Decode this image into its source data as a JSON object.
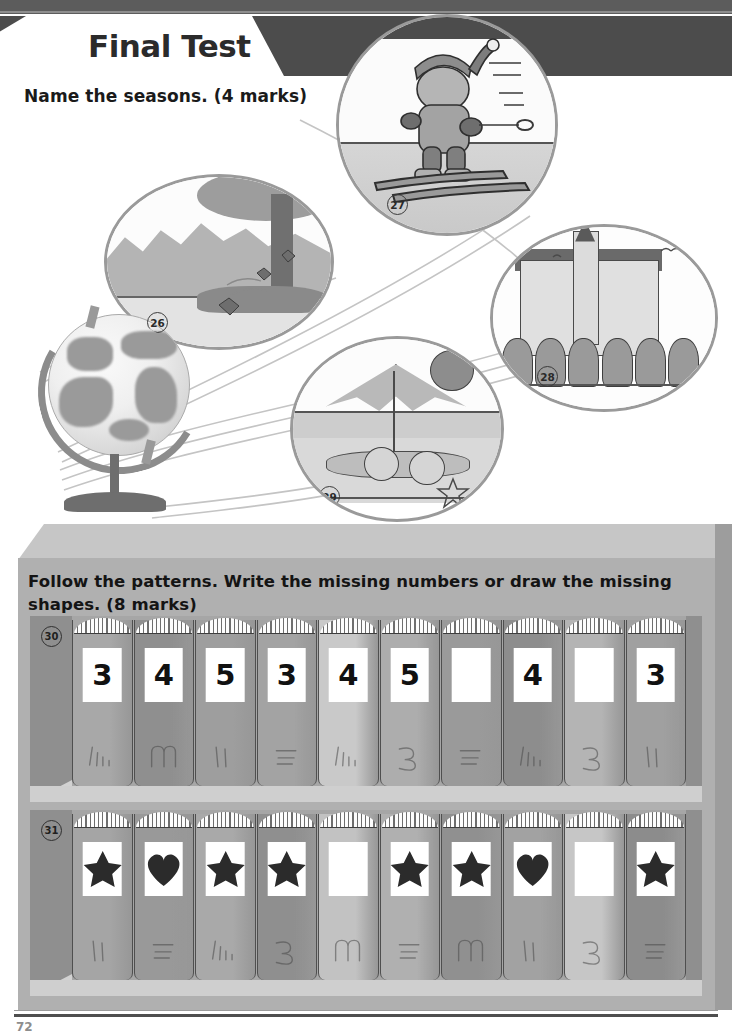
{
  "header": {
    "title": "Final Test"
  },
  "questions": {
    "seasons": {
      "prompt": "Name the seasons.  (4 marks)",
      "items": [
        {
          "number": "26",
          "scene": "autumn-falling-leaves-tree"
        },
        {
          "number": "27",
          "scene": "winter-child-skiing"
        },
        {
          "number": "28",
          "scene": "spring-castle-with-tulips"
        },
        {
          "number": "29",
          "scene": "summer-beach-umbrella-children"
        }
      ]
    },
    "patterns": {
      "prompt": "Follow the patterns.  Write the missing numbers or draw the missing shapes.  (8 marks)",
      "rows": [
        {
          "number": "30",
          "kind": "numbers",
          "books": [
            {
              "label": "3",
              "spine": "#a8a8a8",
              "scribble": "tally"
            },
            {
              "label": "4",
              "spine": "#8f8f8f",
              "scribble": "squiggle"
            },
            {
              "label": "5",
              "spine": "#9e9e9e",
              "scribble": "strokes"
            },
            {
              "label": "3",
              "spine": "#a3a3a3",
              "scribble": "lines"
            },
            {
              "label": "4",
              "spine": "#c9c9c9",
              "scribble": "tally"
            },
            {
              "label": "5",
              "spine": "#adadad",
              "scribble": "three"
            },
            {
              "label": "",
              "spine": "#9a9a9a",
              "scribble": "lines"
            },
            {
              "label": "4",
              "spine": "#8d8d8d",
              "scribble": "tally"
            },
            {
              "label": "",
              "spine": "#b4b4b4",
              "scribble": "three"
            },
            {
              "label": "3",
              "spine": "#a0a0a0",
              "scribble": "strokes"
            }
          ]
        },
        {
          "number": "31",
          "kind": "shapes",
          "books": [
            {
              "label": "star",
              "spine": "#a5a5a5",
              "scribble": "strokes"
            },
            {
              "label": "heart",
              "spine": "#999999",
              "scribble": "lines"
            },
            {
              "label": "star",
              "spine": "#a9a9a9",
              "scribble": "tally"
            },
            {
              "label": "star",
              "spine": "#8f8f8f",
              "scribble": "three"
            },
            {
              "label": "",
              "spine": "#c2c2c2",
              "scribble": "squiggle"
            },
            {
              "label": "star",
              "spine": "#b0b0b0",
              "scribble": "lines"
            },
            {
              "label": "star",
              "spine": "#909090",
              "scribble": "squiggle"
            },
            {
              "label": "heart",
              "spine": "#a2a2a2",
              "scribble": "strokes"
            },
            {
              "label": "",
              "spine": "#c6c6c6",
              "scribble": "three"
            },
            {
              "label": "star",
              "spine": "#8c8c8c",
              "scribble": "lines"
            }
          ]
        }
      ]
    }
  },
  "footer": {
    "page_number": "72"
  },
  "colors": {
    "header_band": "#4c4c4c",
    "shelf_body": "#b0b0b0",
    "shelf_inner": "#a6a6a6",
    "ink": "#1a1a1a"
  }
}
